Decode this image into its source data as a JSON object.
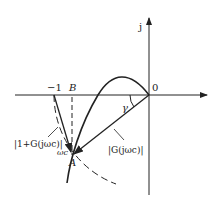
{
  "diagram": {
    "type": "nyquist-plot-phase-margin",
    "axis_labels": {
      "imag": "j",
      "origin": "0"
    },
    "points": {
      "minus_one": "−1",
      "B": "B",
      "A": "A",
      "crossover": "ωc"
    },
    "labels": {
      "gamma": "γ",
      "one_plus_G": "|1+G(jωc)|",
      "G_mag": "|G(jωc)|"
    },
    "colors": {
      "stroke": "#222222",
      "background": "#ffffff"
    }
  }
}
